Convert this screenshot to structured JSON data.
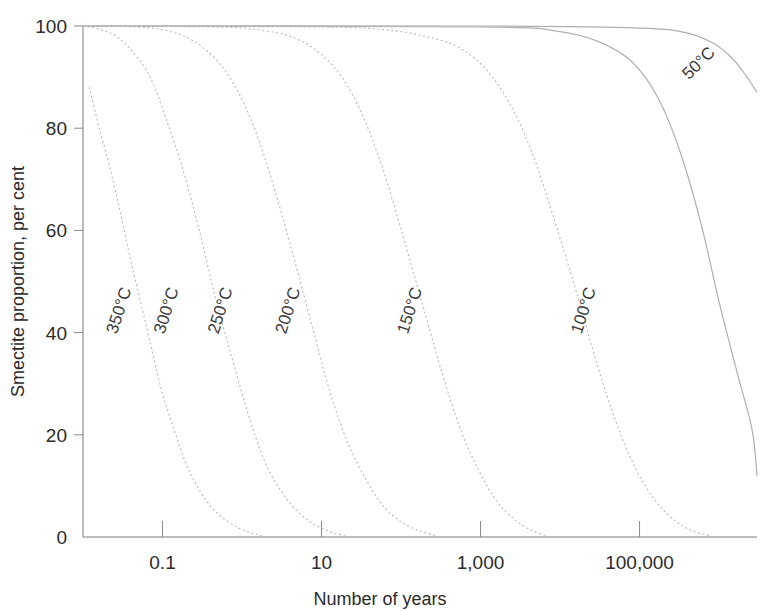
{
  "chart_data": {
    "type": "line",
    "title": "",
    "xlabel": "Number of years",
    "ylabel": "Smectite proportion, per cent",
    "xscale": "log",
    "xlim": [
      0.01,
      3000000
    ],
    "ylim": [
      0,
      100
    ],
    "grid": false,
    "legend_position": "inline-curve-labels",
    "xticks": [
      {
        "value": 0.1,
        "label": "0.1"
      },
      {
        "value": 10,
        "label": "10"
      },
      {
        "value": 1000,
        "label": "1,000"
      },
      {
        "value": 100000,
        "label": "100,000"
      }
    ],
    "yticks": [
      {
        "value": 0,
        "label": "0"
      },
      {
        "value": 20,
        "label": "20"
      },
      {
        "value": 40,
        "label": "40"
      },
      {
        "value": 60,
        "label": "60"
      },
      {
        "value": 80,
        "label": "80"
      },
      {
        "value": 100,
        "label": "100"
      }
    ],
    "series": [
      {
        "name": "350°C",
        "label": "350°C",
        "style": "dotted",
        "label_rotation": -72,
        "label_x": 0.033,
        "label_y": 44,
        "x": [
          0.012,
          0.016,
          0.022,
          0.03,
          0.04,
          0.055,
          0.075,
          0.1,
          0.14,
          0.19,
          0.26,
          0.36,
          0.5,
          0.7,
          0.95,
          1.3,
          1.8
        ],
        "y": [
          88,
          80,
          72,
          63,
          54,
          45,
          36,
          28,
          21,
          15,
          10.5,
          7,
          4.5,
          2.8,
          1.6,
          0.8,
          0.2
        ]
      },
      {
        "name": "300°C",
        "label": "300°C",
        "style": "dotted",
        "label_rotation": -72,
        "label_x": 0.13,
        "label_y": 44,
        "x": [
          0.01,
          0.016,
          0.026,
          0.042,
          0.07,
          0.11,
          0.18,
          0.29,
          0.46,
          0.75,
          1.2,
          1.9,
          3.1,
          5.0,
          8.0,
          13.0,
          20.0
        ],
        "y": [
          100,
          99.4,
          98,
          95,
          90,
          82,
          72,
          60,
          47,
          35,
          24,
          15,
          9,
          5,
          2.5,
          1.0,
          0.2
        ]
      },
      {
        "name": "250°C",
        "label": "250°C",
        "style": "dotted",
        "label_rotation": -72,
        "label_x": 0.62,
        "label_y": 44,
        "x": [
          0.01,
          0.05,
          0.12,
          0.25,
          0.5,
          0.9,
          1.6,
          2.8,
          4.8,
          8.0,
          13.0,
          22.0,
          37.0,
          60.0,
          100.0,
          170.0,
          280.0
        ],
        "y": [
          100,
          99.8,
          99,
          97,
          93,
          87,
          78,
          66,
          53,
          40,
          28,
          18,
          11,
          6,
          3,
          1.2,
          0.2
        ]
      },
      {
        "name": "200°C",
        "label": "200°C",
        "style": "dotted",
        "label_rotation": -72,
        "label_x": 4.4,
        "label_y": 44,
        "x": [
          0.01,
          0.5,
          1.5,
          4.0,
          9.0,
          18.0,
          34.0,
          62.0,
          110.0,
          190.0,
          330.0,
          560.0,
          950.0,
          1600.0,
          2700.0,
          4500.0,
          7000.0
        ],
        "y": [
          100,
          99.8,
          99.3,
          98,
          95,
          90,
          82,
          71,
          58,
          45,
          32,
          21,
          13,
          7,
          3.4,
          1.2,
          0.2
        ]
      },
      {
        "name": "150°C",
        "label": "150°C",
        "style": "dotted",
        "label_rotation": -72,
        "label_x": 150,
        "label_y": 44,
        "x": [
          0.01,
          10,
          60,
          200,
          500,
          1100,
          2300,
          4500,
          8500,
          16000,
          29000,
          52000,
          92000,
          160000,
          280000,
          480000,
          800000
        ],
        "y": [
          100,
          99.8,
          99.3,
          98,
          96,
          92,
          85,
          75,
          62,
          48,
          34,
          22,
          13,
          7,
          3.2,
          1.1,
          0.2
        ]
      },
      {
        "name": "100°C",
        "label": "100°C",
        "style": "solidish",
        "label_rotation": -72,
        "label_x": 23000,
        "label_y": 44,
        "x": [
          0.01,
          1000,
          9000,
          30000,
          80000,
          170000,
          330000,
          600000,
          1000000,
          1700000,
          2600000,
          4000000,
          6000000,
          8500000,
          12000000
        ],
        "y": [
          100,
          99.8,
          99,
          97,
          93,
          86,
          75,
          61,
          46,
          32,
          21,
          12,
          6,
          2.4,
          0.3
        ]
      },
      {
        "name": "50°C",
        "label": "50°C",
        "style": "solidish",
        "label_rotation": -45,
        "label_x": 620000,
        "label_y": 92,
        "x": [
          0.01,
          1000,
          100000,
          400000,
          900000,
          1500000,
          2200000,
          3000000
        ],
        "y": [
          100,
          100,
          99.6,
          98.6,
          96.4,
          93.5,
          90.2,
          87.0
        ]
      }
    ]
  },
  "style": {
    "axis_color": "#7a7a7a",
    "text_color": "#2b2b2b",
    "curve_color": "#b9b9b9",
    "background": "#ffffff"
  }
}
